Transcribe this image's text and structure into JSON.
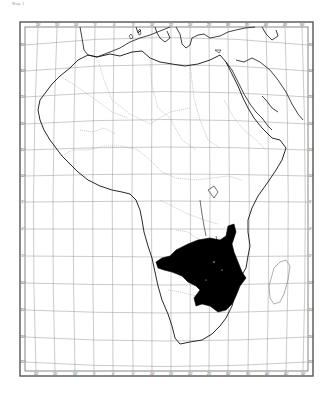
{
  "caption": "Map 1",
  "map": {
    "title": "Africa — distribution map",
    "region": "Africa",
    "frame": {
      "outer": [
        20,
        22,
        313,
        376
      ],
      "inner": [
        25,
        27,
        308,
        371
      ]
    },
    "colors": {
      "frame": "#555555",
      "coast": "#111111",
      "borders": "#9a9a9a",
      "graticule": "#8a8a8a",
      "distribution_fill": "#000000",
      "background": "#ffffff"
    },
    "top_ticks": [
      "20°",
      "15°",
      "10°",
      "5°",
      "0°",
      "5°",
      "10°",
      "15°",
      "20°",
      "25°",
      "30°",
      "35°",
      "40°",
      "45°",
      "50°",
      "55°",
      "60°"
    ],
    "bottom_ticks": [
      "20°",
      "15°",
      "10°",
      "5°",
      "0°",
      "5°",
      "10°",
      "15°",
      "20°",
      "25°",
      "30°",
      "35°",
      "40°",
      "45°",
      "50°",
      "55°",
      "60°"
    ],
    "left_ticks": [
      "35°",
      "30°",
      "25°",
      "20°",
      "15°",
      "10°",
      "5°",
      "0°",
      "5°",
      "10°",
      "15°",
      "20°",
      "25°",
      "30°",
      "35°"
    ],
    "right_ticks": [
      "40°",
      "35°",
      "30°",
      "25°",
      "20°",
      "15°",
      "10°",
      "5°",
      "0°",
      "5°",
      "10°",
      "15°",
      "20°",
      "25°",
      "30°",
      "35°"
    ],
    "legend": {
      "distribution_area": "Species range (south-central Africa)"
    }
  }
}
